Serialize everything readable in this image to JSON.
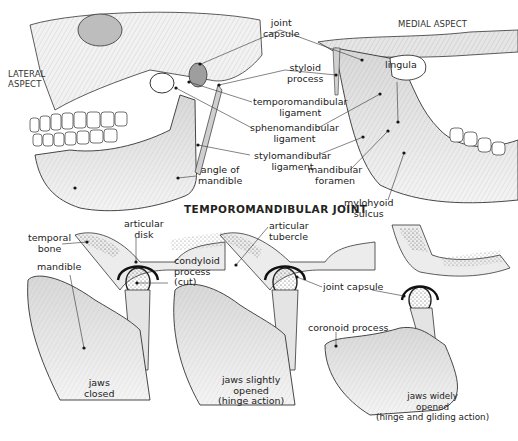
{
  "figure": {
    "title": "TEMPOROMANDIBULAR JOINT",
    "colors": {
      "bone_fill": "#ececec",
      "shade": "#cfcfcf",
      "ink": "#2a2a2a",
      "background": "#ffffff"
    }
  },
  "top_views": {
    "lateral": {
      "caption": [
        "LATERAL",
        "ASPECT"
      ],
      "labels": {
        "angle_of_mandible": [
          "angle of",
          "mandible"
        ]
      }
    },
    "medial": {
      "caption": "MEDIAL ASPECT",
      "labels": {
        "lingula": "lingula",
        "mandibular_foramen": [
          "mandibular",
          "foramen"
        ],
        "mylohyoid_sulcus": [
          "mylohyoid",
          "sulcus"
        ]
      }
    },
    "shared_labels": {
      "joint_capsule": [
        "joint",
        "capsule"
      ],
      "styloid_process": [
        "styloid",
        "process"
      ],
      "temporomandibular_ligament": [
        "temporomandibular",
        "ligament"
      ],
      "sphenomandibular_ligament": [
        "sphenomandibular",
        "ligament"
      ],
      "stylomandibular_ligament": [
        "stylomandibular",
        "ligament"
      ]
    }
  },
  "bottom_views": {
    "labels": {
      "temporal_bone": [
        "temporal",
        "bone"
      ],
      "articular_disk": [
        "articular",
        "disk"
      ],
      "mandible": "mandible",
      "condyloid_process": [
        "condyloid",
        "process",
        "(cut)"
      ],
      "articular_tubercle": [
        "articular",
        "tubercle"
      ],
      "joint_capsule": "joint capsule",
      "coronoid_process": "coronoid process"
    },
    "states": [
      {
        "caption": [
          "jaws",
          "closed"
        ]
      },
      {
        "caption": [
          "jaws slightly",
          "opened",
          "(hinge action)"
        ]
      },
      {
        "caption": [
          "jaws  widely",
          "opened",
          "(hinge and gliding action)"
        ]
      }
    ]
  }
}
